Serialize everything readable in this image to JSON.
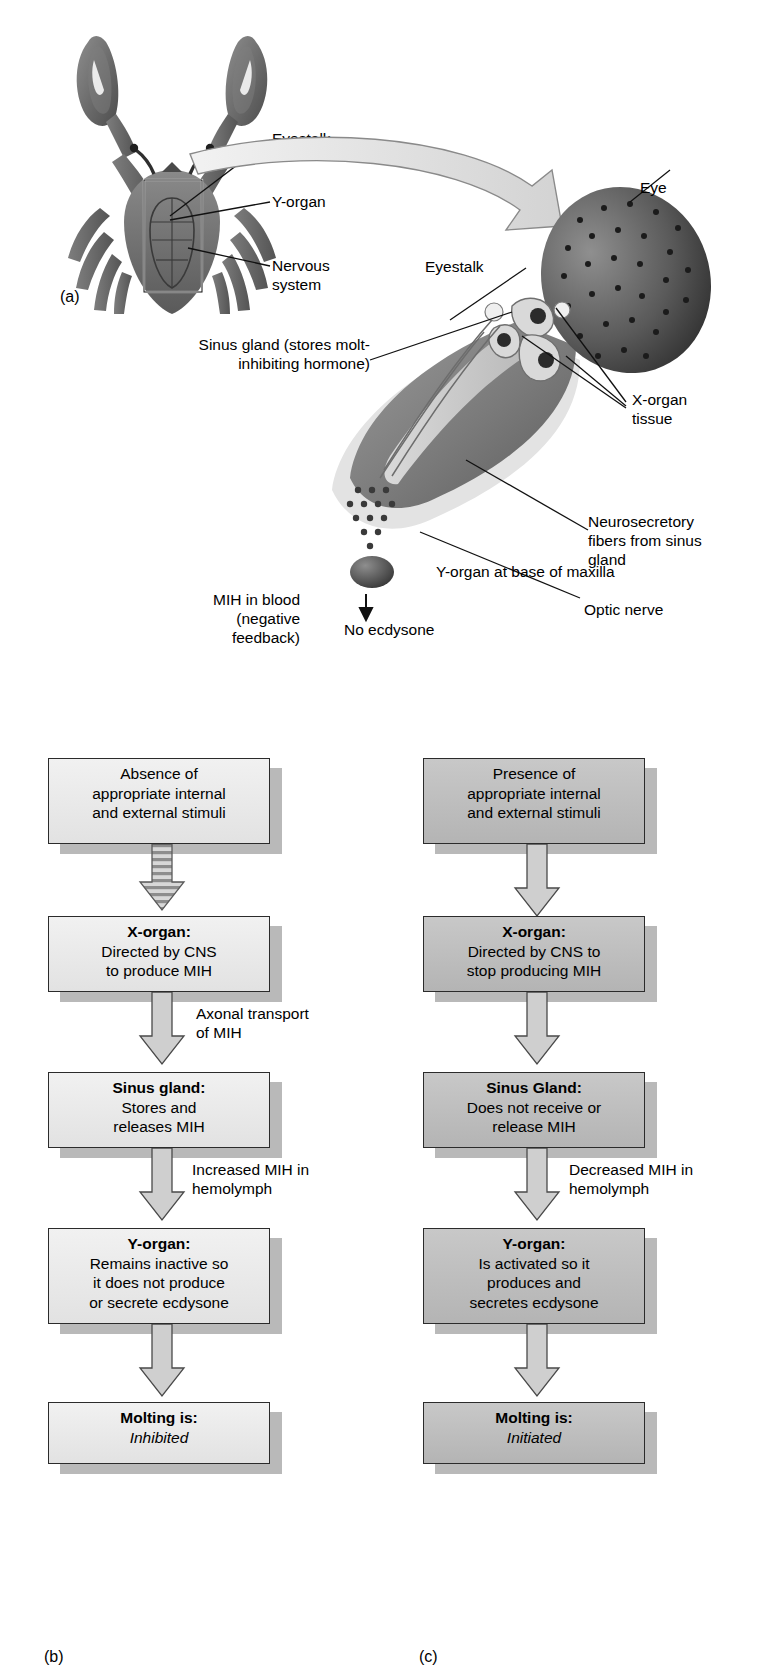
{
  "figure": {
    "panel_a": {
      "letter": "(a)",
      "labels": [
        {
          "name": "eyestalk",
          "text": "Eyestalk"
        },
        {
          "name": "y-organ",
          "text": "Y-organ"
        },
        {
          "name": "nervous-system",
          "text": "Nervous\nsystem"
        }
      ]
    },
    "panel_eyestalk": {
      "labels": [
        {
          "name": "eye",
          "text": "Eye"
        },
        {
          "name": "eyestalk",
          "text": "Eyestalk"
        },
        {
          "name": "sinus-gland",
          "text": "Sinus gland (stores molt-\ninhibiting hormone)"
        },
        {
          "name": "x-organ-tissue",
          "text": "X-organ\ntissue"
        },
        {
          "name": "neurosecretory-fibers",
          "text": "Neurosecretory\nfibers from sinus\ngland"
        },
        {
          "name": "optic-nerve",
          "text": "Optic nerve"
        },
        {
          "name": "mih-in-blood",
          "text": "MIH in blood\n(negative\nfeedback)"
        },
        {
          "name": "y-organ-base-maxilla",
          "text": "Y-organ at base of maxilla"
        },
        {
          "name": "no-ecdysone",
          "text": "No ecdysone"
        }
      ]
    },
    "panel_b": {
      "letter": "(b)",
      "steps": [
        {
          "name": "stimuli",
          "header": "",
          "body": "Absence of\nappropriate internal\nand external stimuli",
          "shade": "light"
        },
        {
          "name": "x-organ",
          "header": "X-organ:",
          "body": "Directed by CNS\nto produce MIH",
          "shade": "light"
        },
        {
          "name": "sinus-gland",
          "header": "Sinus gland:",
          "body": "Stores and\nreleases MIH",
          "shade": "light"
        },
        {
          "name": "y-organ",
          "header": "Y-organ:",
          "body": "Remains inactive so\nit does not produce\nor secrete ecdysone",
          "shade": "light"
        },
        {
          "name": "molting",
          "header": "Molting is:",
          "body": "Inhibited",
          "body_italic": true,
          "shade": "light"
        }
      ],
      "arrow_notes": [
        {
          "name": "axonal-transport",
          "text": "Axonal transport\nof MIH"
        },
        {
          "name": "increased-mih",
          "text": "Increased MIH in\nhemolymph"
        }
      ]
    },
    "panel_c": {
      "letter": "(c)",
      "steps": [
        {
          "name": "stimuli",
          "header": "",
          "body": "Presence of\nappropriate internal\nand external stimuli",
          "shade": "mid"
        },
        {
          "name": "x-organ",
          "header": "X-organ:",
          "body": "Directed by CNS to\nstop producing MIH",
          "shade": "mid"
        },
        {
          "name": "sinus-gland",
          "header": "Sinus Gland:",
          "body": "Does not receive or\nrelease MIH",
          "shade": "mid"
        },
        {
          "name": "y-organ",
          "header": "Y-organ:",
          "body": "Is activated so it\nproduces and\nsecretes ecdysone",
          "shade": "mid"
        },
        {
          "name": "molting",
          "header": "Molting is:",
          "body": "Initiated",
          "body_italic": true,
          "shade": "mid"
        }
      ],
      "arrow_notes": [
        {
          "name": "decreased-mih",
          "text": "Decreased MIH in\nhemolymph"
        }
      ]
    },
    "colors": {
      "box_light": "#e9e9e9",
      "box_mid": "#bcbcbc",
      "box_border": "#2b2b2b",
      "shadow": "#b9b9b9",
      "arrow_fill": "#cfcfcf",
      "arrow_stroke": "#4a4a4a",
      "crab_dark": "#6d6d6d",
      "eyestalk_body": "#8a8a8a",
      "eye_dark": "#4a4a4a"
    }
  }
}
